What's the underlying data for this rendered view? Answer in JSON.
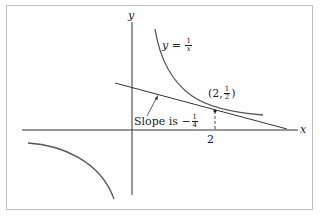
{
  "figure": {
    "axes": {
      "x_label": "x",
      "y_label": "y",
      "x_tick_label": "2"
    },
    "curve": {
      "equation_prefix": "y =",
      "frac_num": "1",
      "frac_den": "x"
    },
    "point": {
      "open": "(2,",
      "frac_num": "1",
      "frac_den": "2",
      "close": ")"
    },
    "slope_label": {
      "prefix": "Slope is −",
      "frac_num": "1",
      "frac_den": "4"
    },
    "colors": {
      "curve": "#555555",
      "axes": "#333333",
      "frame": "#bdbdbd"
    }
  }
}
